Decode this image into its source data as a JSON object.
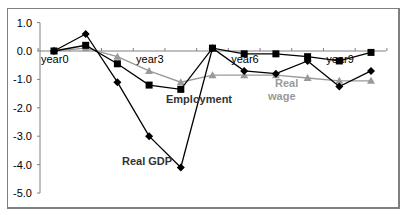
{
  "chart_data": {
    "type": "line",
    "title": "",
    "xlabel": "",
    "ylabel": "",
    "ylim": [
      -5.0,
      1.0
    ],
    "yticks": [
      "1.0",
      "0.0",
      "-1.0",
      "-2.0",
      "-3.0",
      "-4.0",
      "-5.0"
    ],
    "x": [
      "year0",
      "year1",
      "year2",
      "year3",
      "year4",
      "year5",
      "year6",
      "year7",
      "year8",
      "year9",
      "year10"
    ],
    "x_tick_labels_shown": [
      "year0",
      "year3",
      "year6",
      "year9"
    ],
    "grid": false,
    "legend": "inline labels",
    "series": [
      {
        "name": "Real GDP",
        "marker": "diamond",
        "color": "#000000",
        "values": [
          0.0,
          0.6,
          -1.1,
          -3.0,
          -4.1,
          0.1,
          -0.7,
          -0.8,
          -0.35,
          -1.25,
          -0.7
        ]
      },
      {
        "name": "Employment",
        "marker": "square",
        "color": "#000000",
        "values": [
          0.0,
          0.2,
          -0.45,
          -1.2,
          -1.35,
          0.1,
          -0.1,
          -0.1,
          -0.2,
          -0.35,
          -0.05
        ]
      },
      {
        "name": "Real wage",
        "marker": "triangle",
        "color": "#999999",
        "values": [
          0.0,
          0.1,
          -0.2,
          -0.7,
          -1.1,
          -0.85,
          -0.85,
          -0.85,
          -0.95,
          -1.05,
          -1.05
        ]
      }
    ],
    "annotations": [
      {
        "text": "Employment",
        "series": "Employment"
      },
      {
        "text": "Real GDP",
        "series": "Real GDP"
      },
      {
        "text": "Real wage",
        "series": "Real wage"
      }
    ]
  },
  "labels": {
    "employment": "Employment",
    "gdp": "Real GDP",
    "wage_line1": "Real",
    "wage_line2": "wage"
  }
}
